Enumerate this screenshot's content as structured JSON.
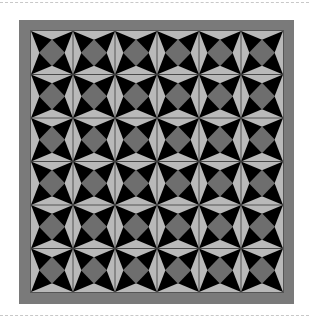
{
  "artwork": {
    "type": "quilt-pattern",
    "block_name": "diamond-star",
    "grid": {
      "columns": 6,
      "rows": 6
    },
    "frame": {
      "x": 19,
      "y": 20,
      "width": 275,
      "height": 284,
      "border_width": 12
    },
    "inner": {
      "x": 31,
      "y": 31,
      "width": 252,
      "height": 261
    },
    "colors": {
      "background": "#000000",
      "frame": "#7a7a7a",
      "frame_inner_edge": "#555555",
      "diamond": "#6e6e6e",
      "spike": "#b9b9b9",
      "seam": "#3a3a3a",
      "page": "#ffffff",
      "dash": "#c8c8c8"
    },
    "geometry": {
      "diamond_inset_ratio": 0.19,
      "spike_depth_ratio": 0.2
    }
  }
}
